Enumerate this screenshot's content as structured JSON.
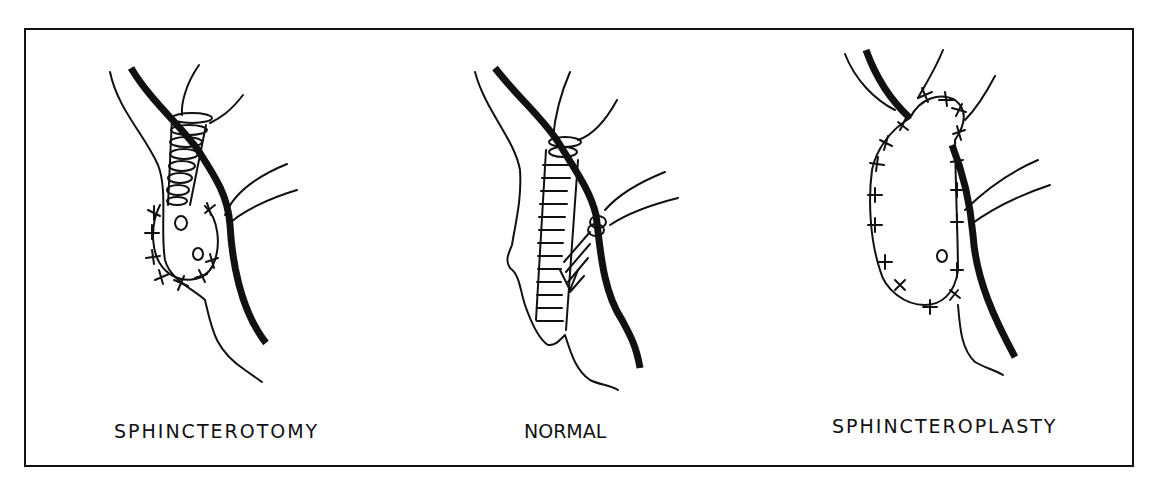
{
  "figure": {
    "type": "surgical-illustration",
    "panels": [
      {
        "id": "sphincterotomy",
        "label": "SPHINCTEROTOMY"
      },
      {
        "id": "normal",
        "label": "NORMAL"
      },
      {
        "id": "sphincteroplasty",
        "label": "SPHINCTEROPLASTY"
      }
    ]
  },
  "colors": {
    "ink": "#111111",
    "background": "#ffffff"
  }
}
